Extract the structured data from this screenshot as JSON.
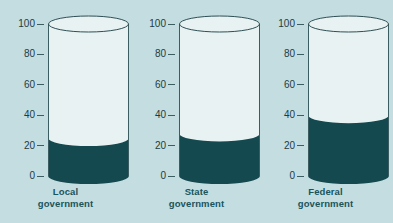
{
  "chart_data": {
    "type": "bar",
    "title": "",
    "subtitle": "",
    "xlabel": "",
    "ylabel": "",
    "categories": [
      "Local government",
      "State government",
      "Federal government"
    ],
    "category_lines": [
      [
        "Local",
        "government"
      ],
      [
        "State",
        "government"
      ],
      [
        "Federal",
        "government"
      ]
    ],
    "values": [
      25,
      28,
      40
    ],
    "ylim": [
      0,
      100
    ],
    "yticks": [
      0,
      20,
      40,
      60,
      80,
      100
    ],
    "ytick_labels": [
      "0",
      "20",
      "40",
      "60",
      "80",
      "100"
    ],
    "grid": false,
    "legend": false,
    "legend_position": "none",
    "series": [
      {
        "name": "Filled share",
        "values": [
          25,
          28,
          40
        ]
      }
    ],
    "marker_style": "cylinder",
    "annotations": []
  },
  "colors": {
    "background": "#c3dde0",
    "cylinder_empty": "#e8f2f2",
    "cylinder_fill": "#14494f",
    "outline": "#3b5c61",
    "tick_text": "#1d3c42",
    "caption_text": "#1a545c"
  }
}
